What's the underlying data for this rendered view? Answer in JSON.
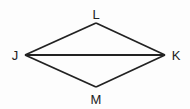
{
  "diagram": {
    "type": "rhombus-with-diagonal",
    "stroke_color": "#222222",
    "vertices": [
      {
        "name": "L",
        "x": 96,
        "y": 23,
        "label_x": 96,
        "label_y": 19
      },
      {
        "name": "J",
        "x": 25,
        "y": 55,
        "label_x": 15,
        "label_y": 60
      },
      {
        "name": "K",
        "x": 165,
        "y": 55,
        "label_x": 176,
        "label_y": 60
      },
      {
        "name": "M",
        "x": 96,
        "y": 87,
        "label_x": 96,
        "label_y": 104
      }
    ],
    "segments": [
      [
        "J",
        "L"
      ],
      [
        "L",
        "K"
      ],
      [
        "K",
        "M"
      ],
      [
        "M",
        "J"
      ],
      [
        "J",
        "K"
      ]
    ],
    "labels": {
      "L": "L",
      "J": "J",
      "K": "K",
      "M": "M"
    }
  }
}
